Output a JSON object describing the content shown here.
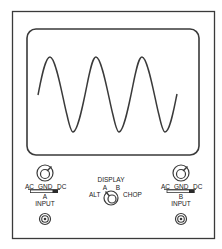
{
  "diagram": {
    "colors": {
      "background": "#ffffff",
      "line": "#3a3a3a",
      "text": "#222222"
    },
    "screen": {
      "waveform": {
        "type": "sine",
        "cycles_visible": 3,
        "peaks": 3,
        "troughs": 3
      }
    },
    "channel_a": {
      "coupling_labels": {
        "ac": "AC",
        "gnd": "GND",
        "dc": "DC"
      },
      "coupling_selected": "DC",
      "channel_label": "A",
      "input_label": "INPUT"
    },
    "channel_b": {
      "coupling_labels": {
        "ac": "AC",
        "gnd": "GND",
        "dc": "DC"
      },
      "coupling_selected": "DC",
      "channel_label": "B",
      "input_label": "INPUT"
    },
    "display": {
      "title": "DISPLAY",
      "options": {
        "a": "A",
        "b": "B",
        "alt": "ALT",
        "chop": "CHOP"
      },
      "selected": "A"
    }
  }
}
